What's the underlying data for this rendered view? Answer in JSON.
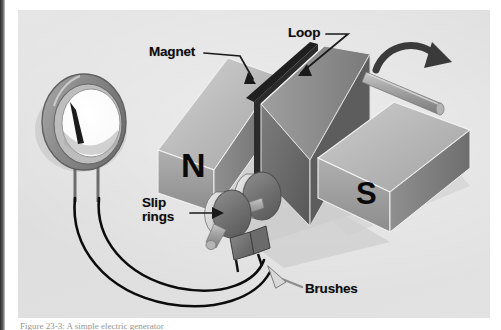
{
  "figure": {
    "panel_background": "#e3e3e3",
    "caption_partial": "Figure 23-3: A simple electric generator"
  },
  "labels": {
    "magnet": "Magnet",
    "loop": "Loop",
    "slip_rings": "Slip rings",
    "brushes": "Brushes"
  },
  "poles": {
    "north": "N",
    "south": "S"
  },
  "components": {
    "meter": {
      "name": "galvanometer",
      "needle_present": true
    },
    "magnet_north_block": "north pole magnet block",
    "magnet_south_block": "south pole magnet block",
    "loop": "rotating wire loop / armature",
    "axle": "rotation axle",
    "slip_ring_a": "slip ring front",
    "slip_ring_b": "slip ring rear",
    "brush_a": "brush left",
    "brush_b": "brush right",
    "lead_wire_a": "meter lead wire upper",
    "lead_wire_b": "meter lead wire lower",
    "rotation_arrow": "rotation-direction arrow"
  },
  "colors": {
    "panel": "#e3e3e3",
    "magnet_light": "#bdbdbd",
    "magnet_mid": "#9a9a9a",
    "magnet_dark": "#6f6f6f",
    "loop_dark": "#5c5c5c",
    "wire": "#111111",
    "label_text": "#0d0d0d",
    "shadow": "#c2c2c2"
  }
}
